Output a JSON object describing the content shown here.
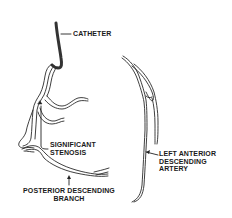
{
  "diagram": {
    "labels": {
      "catheter": "CATHETER",
      "stenosis": [
        "SIGNIFICANT",
        "STENOSIS"
      ],
      "posterior": [
        "POSTERIOR DESCENDING",
        "BRANCH"
      ],
      "lad": [
        "LEFT ANTERIOR",
        "DESCENDING",
        "ARTERY"
      ]
    },
    "colors": {
      "line": "#2a2a2a",
      "fill": "#ffffff",
      "catheter": "#3a3a3a"
    }
  }
}
